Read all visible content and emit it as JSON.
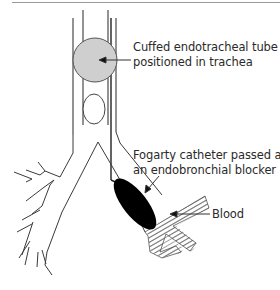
{
  "figure": {
    "labels": {
      "cuff": {
        "line1": "Cuffed endotracheal tube",
        "line2": "positioned in trachea"
      },
      "fogarty": {
        "line1": "Fogarty catheter passed as",
        "line2": "an endobronchial blocker"
      },
      "blood": "Blood"
    },
    "colors": {
      "outline": "#3a3a3a",
      "cuff_fill": "#cfcfcf",
      "blocker_fill": "#000000",
      "hatch": "#555555",
      "text": "#2a2a2a"
    }
  }
}
